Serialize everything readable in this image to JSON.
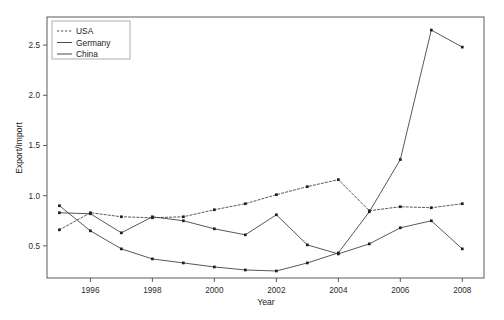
{
  "chart_data": {
    "type": "line",
    "title": "",
    "xlabel": "Year",
    "ylabel": "Export/Import",
    "xlim": [
      1994.6,
      2008.7
    ],
    "ylim": [
      0.18,
      2.78
    ],
    "xticks": [
      1996,
      1998,
      2000,
      2002,
      2004,
      2006,
      2008
    ],
    "xtick_labels": [
      "1996",
      "1998",
      "2000",
      "2002",
      "2004",
      "2006",
      "2008"
    ],
    "yticks": [
      0.5,
      1.0,
      1.5,
      2.0,
      2.5
    ],
    "ytick_labels": [
      "0.5",
      "1.0",
      "1.5",
      "2.0",
      "2.5"
    ],
    "grid": false,
    "legend_position": "top-left",
    "x": [
      1995,
      1996,
      1997,
      1998,
      1999,
      2000,
      2001,
      2002,
      2003,
      2004,
      2005,
      2006,
      2007,
      2008
    ],
    "series": [
      {
        "name": "USA",
        "style": "dotted",
        "marker": "square",
        "values": [
          0.66,
          0.83,
          0.79,
          0.78,
          0.79,
          0.86,
          0.92,
          1.01,
          1.09,
          1.16,
          0.85,
          0.89,
          0.88,
          0.92
        ]
      },
      {
        "name": "Germany",
        "style": "solid",
        "marker": "square",
        "values": [
          0.83,
          0.82,
          0.63,
          0.79,
          0.75,
          0.67,
          0.61,
          0.81,
          0.51,
          0.42,
          0.52,
          0.68,
          0.75,
          0.47
        ]
      },
      {
        "name": "China",
        "style": "solid",
        "marker": "square",
        "values": [
          0.9,
          0.65,
          0.47,
          0.37,
          0.33,
          0.29,
          0.26,
          0.25,
          0.33,
          0.43,
          0.84,
          1.36,
          2.65,
          2.48
        ]
      }
    ]
  },
  "legend": {
    "items": [
      {
        "label": "USA"
      },
      {
        "label": "Germany"
      },
      {
        "label": "China"
      }
    ]
  },
  "colors": {
    "line": "#3a3a3a",
    "axis": "#4a4a4a",
    "text": "#1a1a1a",
    "background": "#ffffff"
  }
}
